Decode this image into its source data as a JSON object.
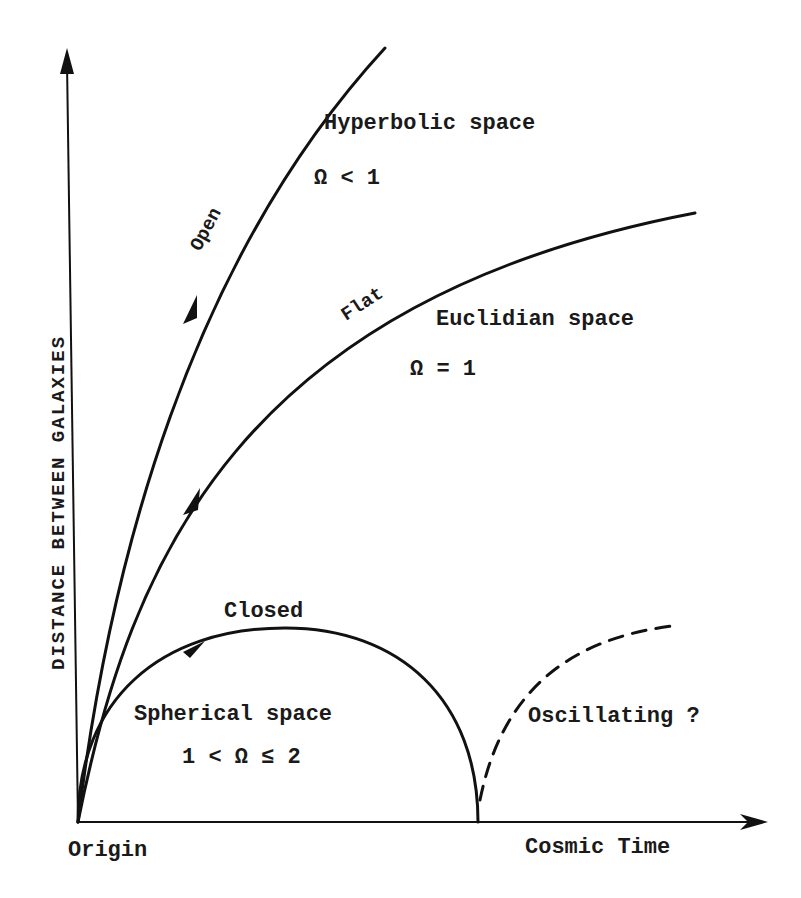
{
  "diagram": {
    "title": "",
    "axes": {
      "y_label": "DISTANCE BETWEEN GALAXIES",
      "x_label": "Cosmic Time",
      "origin_label": "Origin"
    },
    "curves": [
      {
        "id": "open",
        "label": "Open",
        "space": "Hyperbolic space",
        "condition": "Ω < 1",
        "style": "solid"
      },
      {
        "id": "flat",
        "label": "Flat",
        "space": "Euclidian space",
        "condition": "Ω = 1",
        "style": "solid"
      },
      {
        "id": "closed",
        "label": "Closed",
        "space": "Spherical space",
        "condition": "1 < Ω ≤ 2",
        "style": "solid"
      },
      {
        "id": "oscillating",
        "label": "Oscillating ?",
        "style": "dashed"
      }
    ]
  },
  "colors": {
    "ink": "#111111",
    "background": "#ffffff"
  }
}
